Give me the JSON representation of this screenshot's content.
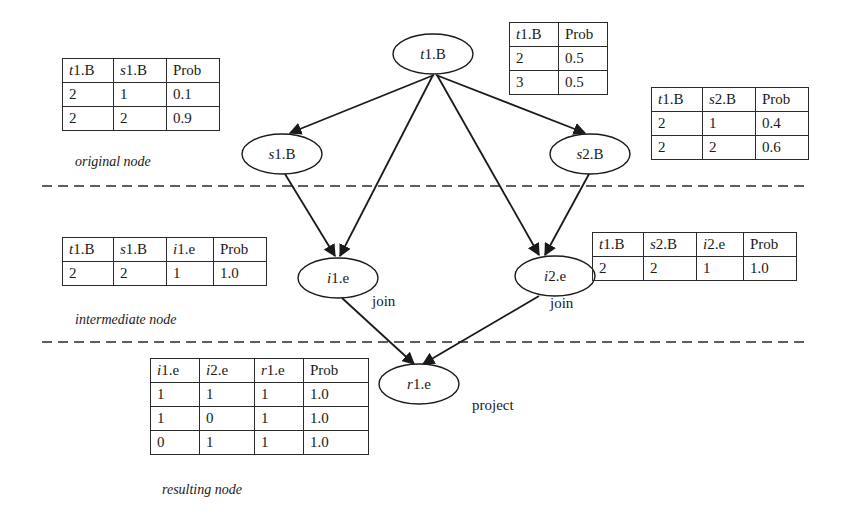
{
  "diagram": {
    "layers": [
      {
        "id": "original",
        "label": "original node"
      },
      {
        "id": "intermediate",
        "label": "intermediate node"
      },
      {
        "id": "resulting",
        "label": "resulting node"
      }
    ],
    "nodes": {
      "t1B": {
        "var": "t",
        "rest": "1.B",
        "layer": "original"
      },
      "s1B": {
        "var": "s",
        "rest": "1.B",
        "layer": "original"
      },
      "s2B": {
        "var": "s",
        "rest": "2.B",
        "layer": "original"
      },
      "i1e": {
        "var": "i",
        "rest": "1.e",
        "layer": "intermediate",
        "op": "join"
      },
      "i2e": {
        "var": "i",
        "rest": "2.e",
        "layer": "intermediate",
        "op": "join"
      },
      "r1e": {
        "var": "r",
        "rest": "1.e",
        "layer": "resulting",
        "op": "project"
      }
    },
    "edges": [
      {
        "from": "t1.B",
        "to": "s1.B"
      },
      {
        "from": "t1.B",
        "to": "s2.B"
      },
      {
        "from": "t1.B",
        "to": "i1.e"
      },
      {
        "from": "t1.B",
        "to": "i2.e"
      },
      {
        "from": "s1.B",
        "to": "i1.e"
      },
      {
        "from": "s2.B",
        "to": "i2.e"
      },
      {
        "from": "i1.e",
        "to": "r1.e"
      },
      {
        "from": "i2.e",
        "to": "r1.e"
      }
    ],
    "tables": {
      "t1B_prior": {
        "headers": [
          {
            "var": "t",
            "rest": "1.B"
          },
          {
            "var": "",
            "rest": "Prob"
          }
        ],
        "rows": [
          [
            "2",
            "0.5"
          ],
          [
            "3",
            "0.5"
          ]
        ]
      },
      "s1B_cpt": {
        "headers": [
          {
            "var": "t",
            "rest": "1.B"
          },
          {
            "var": "s",
            "rest": "1.B"
          },
          {
            "var": "",
            "rest": "Prob"
          }
        ],
        "rows": [
          [
            "2",
            "1",
            "0.1"
          ],
          [
            "2",
            "2",
            "0.9"
          ]
        ]
      },
      "s2B_cpt": {
        "headers": [
          {
            "var": "t",
            "rest": "1.B"
          },
          {
            "var": "s",
            "rest": "2.B"
          },
          {
            "var": "",
            "rest": "Prob"
          }
        ],
        "rows": [
          [
            "2",
            "1",
            "0.4"
          ],
          [
            "2",
            "2",
            "0.6"
          ]
        ]
      },
      "i1e_cpt": {
        "headers": [
          {
            "var": "t",
            "rest": "1.B"
          },
          {
            "var": "s",
            "rest": "1.B"
          },
          {
            "var": "i",
            "rest": "1.e"
          },
          {
            "var": "",
            "rest": "Prob"
          }
        ],
        "rows": [
          [
            "2",
            "2",
            "1",
            "1.0"
          ]
        ]
      },
      "i2e_cpt": {
        "headers": [
          {
            "var": "t",
            "rest": "1.B"
          },
          {
            "var": "s",
            "rest": "2.B"
          },
          {
            "var": "i",
            "rest": "2.e"
          },
          {
            "var": "",
            "rest": "Prob"
          }
        ],
        "rows": [
          [
            "2",
            "2",
            "1",
            "1.0"
          ]
        ]
      },
      "r1e_cpt": {
        "headers": [
          {
            "var": "i",
            "rest": "1.e"
          },
          {
            "var": "i",
            "rest": "2.e"
          },
          {
            "var": "r",
            "rest": "1.e"
          },
          {
            "var": "",
            "rest": "Prob"
          }
        ],
        "rows": [
          [
            "1",
            "1",
            "1",
            "1.0"
          ],
          [
            "1",
            "0",
            "1",
            "1.0"
          ],
          [
            "0",
            "1",
            "1",
            "1.0"
          ]
        ]
      }
    }
  }
}
